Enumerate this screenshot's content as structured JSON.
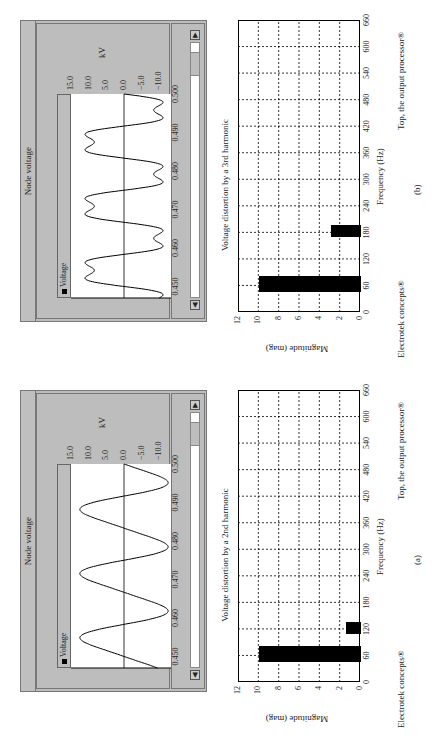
{
  "figures": [
    {
      "id": "b",
      "label": "(b)",
      "node_voltage": {
        "title": "Node voltage",
        "legend": "Voltage",
        "ylabel": "kV",
        "yticks": [
          "15.0",
          "10.0",
          "5.0",
          "0.0",
          "−5.0",
          "−10.0",
          "−15.0"
        ],
        "xticks": [
          "0.450",
          "0.460",
          "0.470",
          "0.480",
          "0.490",
          "0.500"
        ],
        "scroll_left": "◀",
        "scroll_right": "▶"
      },
      "bar_chart": {
        "title": "Voltage distortion by a 3rd harmonic",
        "xlabel": "Frequency (Hz)",
        "ylabel": "Magnitude (mag)",
        "credit_left": "Electrotek concepts®",
        "credit_right": "Top, the output processor®"
      }
    },
    {
      "id": "a",
      "label": "(a)",
      "node_voltage": {
        "title": "Node voltage",
        "legend": "Voltage",
        "ylabel": "kV",
        "yticks": [
          "15.0",
          "10.0",
          "5.0",
          "0.0",
          "−5.0",
          "−10.0",
          "−15.0"
        ],
        "xticks": [
          "0.450",
          "0.460",
          "0.470",
          "0.480",
          "0.490",
          "0.500"
        ],
        "scroll_left": "◀",
        "scroll_right": "▶"
      },
      "bar_chart": {
        "title": "Voltage distortion by a 2nd harmonic",
        "xlabel": "Frequency (Hz)",
        "ylabel": "Magnitude (mag)",
        "credit_left": "Electrotek concepts®",
        "credit_right": "Top, the output processor®"
      }
    }
  ],
  "chart_data": [
    {
      "type": "line",
      "title": "Node voltage (b)",
      "xlabel": "Time (s)",
      "ylabel": "kV",
      "xlim": [
        0.447,
        0.5
      ],
      "ylim": [
        -15,
        15
      ],
      "series": [
        {
          "name": "Voltage",
          "description": "60 Hz fundamental (~10 kV peak) distorted by 3rd harmonic (~3 kV)",
          "fundamental_hz": 60,
          "fundamental_amp": 10,
          "harmonic_order": 3,
          "harmonic_amp": 3
        }
      ],
      "xticks": [
        0.45,
        0.46,
        0.47,
        0.48,
        0.49,
        0.5
      ],
      "yticks": [
        15,
        10,
        5,
        0,
        -5,
        -10,
        -15
      ],
      "legend": [
        "Voltage"
      ]
    },
    {
      "type": "bar",
      "title": "Voltage distortion by a 3rd harmonic",
      "xlabel": "Frequency (Hz)",
      "ylabel": "Magnitude (mag)",
      "categories": [
        60,
        180
      ],
      "values": [
        10,
        3
      ],
      "xlim": [
        0,
        660
      ],
      "ylim": [
        0,
        12
      ],
      "xticks": [
        0,
        60,
        120,
        180,
        240,
        300,
        360,
        420,
        480,
        540,
        600,
        660
      ],
      "yticks": [
        0,
        2,
        4,
        6,
        8,
        10,
        12
      ],
      "grid": true
    },
    {
      "type": "line",
      "title": "Node voltage (a)",
      "xlabel": "Time (s)",
      "ylabel": "kV",
      "xlim": [
        0.447,
        0.5
      ],
      "ylim": [
        -15,
        15
      ],
      "series": [
        {
          "name": "Voltage",
          "description": "60 Hz fundamental (~10 kV peak) with small 2nd harmonic (~1.5 kV)",
          "fundamental_hz": 60,
          "fundamental_amp": 10,
          "harmonic_order": 2,
          "harmonic_amp": 1.5
        }
      ],
      "xticks": [
        0.45,
        0.46,
        0.47,
        0.48,
        0.49,
        0.5
      ],
      "yticks": [
        15,
        10,
        5,
        0,
        -5,
        -10,
        -15
      ],
      "legend": [
        "Voltage"
      ]
    },
    {
      "type": "bar",
      "title": "Voltage distortion by a 2nd harmonic",
      "xlabel": "Frequency (Hz)",
      "ylabel": "Magnitude (mag)",
      "categories": [
        60,
        120
      ],
      "values": [
        10,
        1.5
      ],
      "xlim": [
        0,
        660
      ],
      "ylim": [
        0,
        12
      ],
      "xticks": [
        0,
        60,
        120,
        180,
        240,
        300,
        360,
        420,
        480,
        540,
        600,
        660
      ],
      "yticks": [
        0,
        2,
        4,
        6,
        8,
        10,
        12
      ],
      "grid": true
    }
  ]
}
